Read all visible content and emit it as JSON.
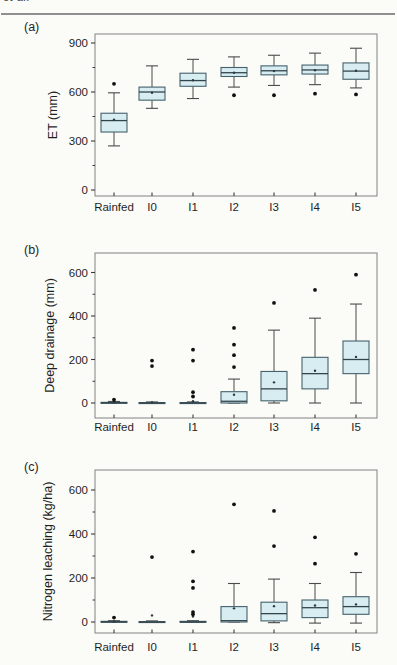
{
  "header": {
    "fragment": "et al."
  },
  "figure": {
    "colors": {
      "box_fill": "#d7edf1",
      "box_stroke": "#45626c",
      "whisker": "#4a4a4a",
      "median": "#33454c",
      "mean_dot": "#2a3a40",
      "outlier": "#111111",
      "frame": "#828282",
      "tick": "#3a3a3a",
      "text": "#1f1f1f"
    }
  },
  "chart_data": [
    {
      "type": "box",
      "id": "a",
      "panel_label": "(a)",
      "ylabel": "ET (mm)",
      "yticks": [
        0,
        300,
        600,
        900
      ],
      "ylim": [
        -35,
        955
      ],
      "categories": [
        "Rainfed",
        "I0",
        "I1",
        "I2",
        "I3",
        "I4",
        "I5"
      ],
      "boxes": [
        {
          "low": 270,
          "q1": 355,
          "median": 425,
          "mean": 430,
          "q3": 470,
          "high": 595,
          "outliers": [
            650
          ]
        },
        {
          "low": 500,
          "q1": 550,
          "median": 600,
          "mean": 595,
          "q3": 630,
          "high": 760,
          "outliers": []
        },
        {
          "low": 560,
          "q1": 635,
          "median": 670,
          "mean": 672,
          "q3": 715,
          "high": 800,
          "outliers": []
        },
        {
          "low": 630,
          "q1": 695,
          "median": 718,
          "mean": 718,
          "q3": 750,
          "high": 815,
          "outliers": [
            580
          ]
        },
        {
          "low": 640,
          "q1": 705,
          "median": 730,
          "mean": 728,
          "q3": 760,
          "high": 825,
          "outliers": [
            580
          ]
        },
        {
          "low": 645,
          "q1": 710,
          "median": 735,
          "mean": 733,
          "q3": 765,
          "high": 838,
          "outliers": [
            590
          ]
        },
        {
          "low": 625,
          "q1": 678,
          "median": 728,
          "mean": 730,
          "q3": 778,
          "high": 868,
          "outliers": [
            585
          ]
        }
      ]
    },
    {
      "type": "box",
      "id": "b",
      "panel_label": "(b)",
      "ylabel": "Deep drainage (mm)",
      "yticks": [
        0,
        200,
        400,
        600
      ],
      "ylim": [
        -65,
        690
      ],
      "categories": [
        "Rainfed",
        "I0",
        "I1",
        "I2",
        "I3",
        "I4",
        "I5"
      ],
      "boxes": [
        {
          "low": 0,
          "q1": 0,
          "median": 1,
          "mean": 3,
          "q3": 3,
          "high": 7,
          "outliers": [
            15
          ]
        },
        {
          "low": 0,
          "q1": 0,
          "median": 0,
          "mean": 2,
          "q3": 2,
          "high": 5,
          "outliers": [
            170,
            195
          ]
        },
        {
          "low": 0,
          "q1": 0,
          "median": 0,
          "mean": 8,
          "q3": 2,
          "high": 5,
          "outliers": [
            30,
            50,
            195,
            245
          ]
        },
        {
          "low": 0,
          "q1": 0,
          "median": 8,
          "mean": 38,
          "q3": 52,
          "high": 110,
          "outliers": [
            165,
            220,
            268,
            345
          ]
        },
        {
          "low": 0,
          "q1": 10,
          "median": 65,
          "mean": 95,
          "q3": 145,
          "high": 335,
          "outliers": [
            460
          ]
        },
        {
          "low": 0,
          "q1": 65,
          "median": 135,
          "mean": 148,
          "q3": 210,
          "high": 390,
          "outliers": [
            520
          ]
        },
        {
          "low": 0,
          "q1": 135,
          "median": 200,
          "mean": 212,
          "q3": 285,
          "high": 455,
          "outliers": [
            590
          ]
        }
      ]
    },
    {
      "type": "box",
      "id": "c",
      "panel_label": "(c)",
      "ylabel": "Nitrogen leaching (kg/ha)",
      "yticks": [
        0,
        200,
        400,
        600
      ],
      "ylim": [
        -50,
        690
      ],
      "categories": [
        "Rainfed",
        "I0",
        "I1",
        "I2",
        "I3",
        "I4",
        "I5"
      ],
      "boxes": [
        {
          "low": 0,
          "q1": 0,
          "median": 1,
          "mean": 2,
          "q3": 3,
          "high": 6,
          "outliers": [
            20
          ]
        },
        {
          "low": 0,
          "q1": 0,
          "median": 0,
          "mean": 30,
          "q3": 2,
          "high": 5,
          "outliers": [
            295
          ]
        },
        {
          "low": 0,
          "q1": 0,
          "median": 0,
          "mean": 25,
          "q3": 3,
          "high": 6,
          "outliers": [
            35,
            45,
            155,
            185,
            320
          ]
        },
        {
          "low": 0,
          "q1": 0,
          "median": 6,
          "mean": 62,
          "q3": 70,
          "high": 175,
          "outliers": [
            535
          ]
        },
        {
          "low": -3,
          "q1": 5,
          "median": 38,
          "mean": 72,
          "q3": 90,
          "high": 195,
          "outliers": [
            345,
            505
          ]
        },
        {
          "low": -5,
          "q1": 20,
          "median": 65,
          "mean": 75,
          "q3": 100,
          "high": 175,
          "outliers": [
            265,
            385
          ]
        },
        {
          "low": -5,
          "q1": 35,
          "median": 70,
          "mean": 80,
          "q3": 115,
          "high": 225,
          "outliers": [
            310
          ]
        }
      ]
    }
  ]
}
